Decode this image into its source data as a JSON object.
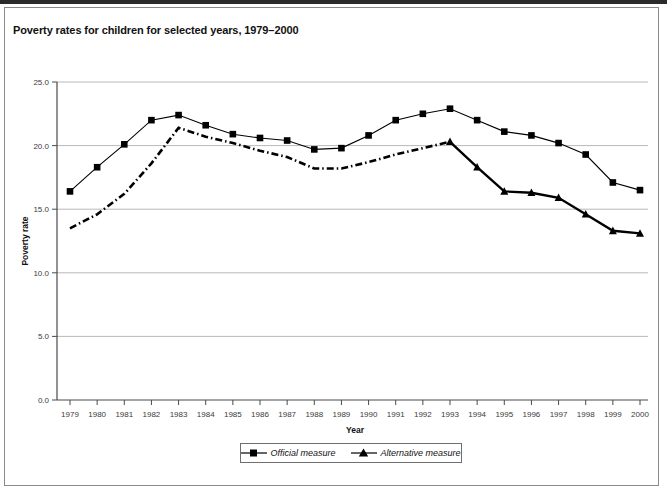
{
  "figure": {
    "title": "Poverty rates for children for selected years, 1979–2000"
  },
  "legend": {
    "entries": [
      {
        "label": "Official measure",
        "marker": "square-marker-icon",
        "color": "#000000",
        "dash": "solid"
      },
      {
        "label": "Alternative measure",
        "marker": "triangle-marker-icon",
        "color": "#000000",
        "dash": "dash-dot"
      }
    ]
  },
  "chart_data": {
    "type": "line",
    "title": "Poverty rates for children for selected years, 1979–2000",
    "xlabel": "Year",
    "ylabel": "Poverty rate",
    "categories": [
      "1979",
      "1980",
      "1981",
      "1982",
      "1983",
      "1984",
      "1985",
      "1986",
      "1987",
      "1988",
      "1989",
      "1990",
      "1991",
      "1992",
      "1993",
      "1994",
      "1995",
      "1996",
      "1997",
      "1998",
      "1999",
      "2000"
    ],
    "x": [
      1979,
      1980,
      1981,
      1982,
      1983,
      1984,
      1985,
      1986,
      1987,
      1988,
      1989,
      1990,
      1991,
      1992,
      1993,
      1994,
      1995,
      1996,
      1997,
      1998,
      1999,
      2000
    ],
    "ylim": [
      0.0,
      25.0
    ],
    "yticks": [
      "0.0",
      "5.0",
      "10.0",
      "15.0",
      "20.0",
      "25.0"
    ],
    "ytick_values": [
      0.0,
      5.0,
      10.0,
      15.0,
      20.0,
      25.0
    ],
    "grid": "horizontal",
    "legend_position": "bottom",
    "series": [
      {
        "name": "Official measure",
        "marker": "square",
        "linestyle": "solid",
        "color": "#000000",
        "values": [
          16.4,
          18.3,
          20.1,
          22.0,
          22.4,
          21.6,
          20.9,
          20.6,
          20.4,
          19.7,
          19.8,
          20.8,
          22.0,
          22.5,
          22.9,
          22.0,
          21.1,
          20.8,
          20.2,
          19.3,
          17.1,
          16.5
        ]
      },
      {
        "name": "Alternative measure",
        "marker": "triangle",
        "linestyle": "dash-dot",
        "color": "#000000",
        "values": [
          13.5,
          14.6,
          16.2,
          18.6,
          21.4,
          20.7,
          20.2,
          19.6,
          19.1,
          18.2,
          18.2,
          18.7,
          19.3,
          19.8,
          20.3,
          18.3,
          16.4,
          16.3,
          15.9,
          14.6,
          13.3,
          13.1
        ]
      }
    ]
  }
}
